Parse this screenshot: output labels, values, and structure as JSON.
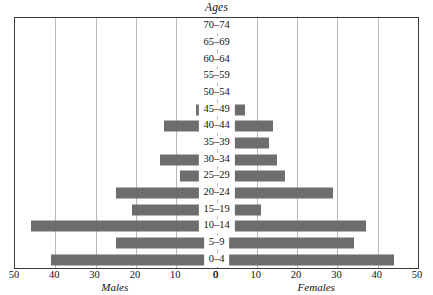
{
  "chart_data": {
    "type": "bar",
    "subtype": "population-pyramid",
    "title": "Ages",
    "xlabel": "",
    "ylabel": "Ages",
    "left_caption": "Males",
    "right_caption": "Females",
    "grid": true,
    "legend_position": "none",
    "bar_color": "#6d6d6d",
    "frame_color": "#3a3a3a",
    "gridline_color": "#b9b9b9",
    "background_color": "#ffffff",
    "axis_max": 50,
    "axis_min": 0,
    "axis_ticks": [
      50,
      40,
      30,
      20,
      10,
      0
    ],
    "left_tick_labels": [
      "50",
      "40",
      "30",
      "20",
      "10",
      "0"
    ],
    "right_tick_labels": [
      "0",
      "10",
      "20",
      "30",
      "40",
      "50"
    ],
    "categories": [
      "70–74",
      "65–69",
      "60–64",
      "55–59",
      "50–54",
      "45–49",
      "40–44",
      "35–39",
      "30–34",
      "25–29",
      "20–24",
      "15–19",
      "10–14",
      "5–9",
      "0–4"
    ],
    "series": [
      {
        "name": "Males",
        "side": "left",
        "values": [
          1,
          0,
          2,
          2,
          2,
          5,
          13,
          4,
          14,
          9,
          25,
          21,
          46,
          25,
          41
        ]
      },
      {
        "name": "Females",
        "side": "right",
        "values": [
          0,
          2,
          3,
          2,
          3,
          7,
          14,
          13,
          15,
          17,
          29,
          11,
          37,
          34,
          44
        ]
      }
    ]
  }
}
